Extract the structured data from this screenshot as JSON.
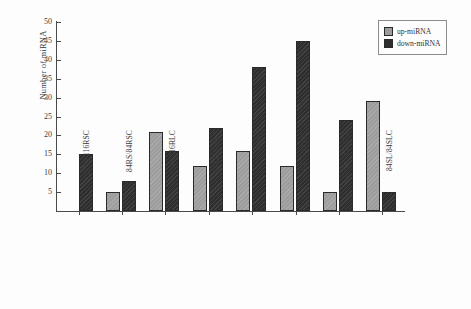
{
  "chart_data": {
    "type": "bar",
    "title": "",
    "xlabel": "",
    "ylabel": "Number of miRNA",
    "ylim": [
      0,
      50
    ],
    "yticks": [
      0,
      5,
      10,
      15,
      20,
      25,
      30,
      35,
      40,
      45,
      50
    ],
    "grid": false,
    "legend_position": "top-right",
    "categories": [
      "116RS/116RSC",
      "84RS/84RSC",
      "116RS/116RLC",
      "84RL/84RLC",
      "116SS/116SSC",
      "84SS/84SSC",
      "116SL/116SLC",
      "84SL/84SLC"
    ],
    "series": [
      {
        "name": "up-miRNA",
        "color": "#9d9d9d",
        "values": [
          0,
          5,
          21,
          12,
          16,
          12,
          5,
          29
        ]
      },
      {
        "name": "down-miRNA",
        "color": "#2e2e2e",
        "values": [
          15,
          8,
          16,
          22,
          38,
          45,
          24,
          5
        ]
      }
    ]
  },
  "legend": {
    "items": [
      {
        "label": "up-miRNA"
      },
      {
        "label": "down-miRNA"
      }
    ]
  },
  "axis": {
    "y_title": "Number of miRNA"
  }
}
